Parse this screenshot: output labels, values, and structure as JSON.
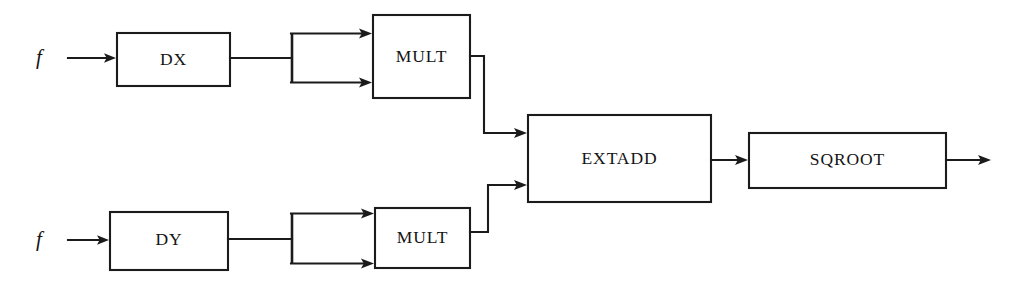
{
  "diagram": {
    "type": "block-diagram",
    "canvas": {
      "width": 1014,
      "height": 288
    },
    "colors": {
      "background": "#ffffff",
      "stroke": "#1b1b1b",
      "text": "#141414"
    },
    "sources": [
      {
        "id": "src-top",
        "label": "f",
        "x": 39,
        "y": 58
      },
      {
        "id": "src-bottom",
        "label": "f",
        "x": 39,
        "y": 240
      }
    ],
    "blocks": [
      {
        "id": "dx",
        "label": "DX",
        "x": 117,
        "y": 33,
        "w": 113,
        "h": 53
      },
      {
        "id": "mult-x",
        "label": "MULT",
        "x": 373,
        "y": 15,
        "w": 97,
        "h": 83
      },
      {
        "id": "dy",
        "label": "DY",
        "x": 110,
        "y": 212,
        "w": 118,
        "h": 58
      },
      {
        "id": "mult-y",
        "label": "MULT",
        "x": 375,
        "y": 208,
        "w": 95,
        "h": 60
      },
      {
        "id": "extadd",
        "label": "EXTADD",
        "x": 528,
        "y": 115,
        "w": 183,
        "h": 87
      },
      {
        "id": "sqroot",
        "label": "SQROOT",
        "x": 749,
        "y": 133,
        "w": 197,
        "h": 55
      }
    ],
    "forks": [
      {
        "id": "fork-x",
        "x": 292,
        "y_top": 33,
        "y_bottom": 83
      },
      {
        "id": "fork-y",
        "x": 292,
        "y_top": 213,
        "y_bottom": 264
      }
    ],
    "edges": [
      {
        "id": "edge-f-dx",
        "from": "src-top",
        "to": "dx",
        "arrow": true
      },
      {
        "id": "edge-dx-fork",
        "from": "dx",
        "to": "fork-x",
        "arrow": false
      },
      {
        "id": "edge-fork-mult-x-1",
        "from": "fork-x",
        "to": "mult-x",
        "arrow": true
      },
      {
        "id": "edge-fork-mult-x-2",
        "from": "fork-x",
        "to": "mult-x",
        "arrow": true
      },
      {
        "id": "edge-mult-x-extadd",
        "from": "mult-x",
        "to": "extadd",
        "arrow": true
      },
      {
        "id": "edge-f-dy",
        "from": "src-bottom",
        "to": "dy",
        "arrow": true
      },
      {
        "id": "edge-dy-fork",
        "from": "dy",
        "to": "fork-y",
        "arrow": false
      },
      {
        "id": "edge-fork-mult-y-1",
        "from": "fork-y",
        "to": "mult-y",
        "arrow": true
      },
      {
        "id": "edge-fork-mult-y-2",
        "from": "fork-y",
        "to": "mult-y",
        "arrow": true
      },
      {
        "id": "edge-mult-y-extadd",
        "from": "mult-y",
        "to": "extadd",
        "arrow": true
      },
      {
        "id": "edge-extadd-sqroot",
        "from": "extadd",
        "to": "sqroot",
        "arrow": true
      },
      {
        "id": "edge-sqroot-out",
        "from": "sqroot",
        "to": "output",
        "arrow": true
      }
    ]
  }
}
